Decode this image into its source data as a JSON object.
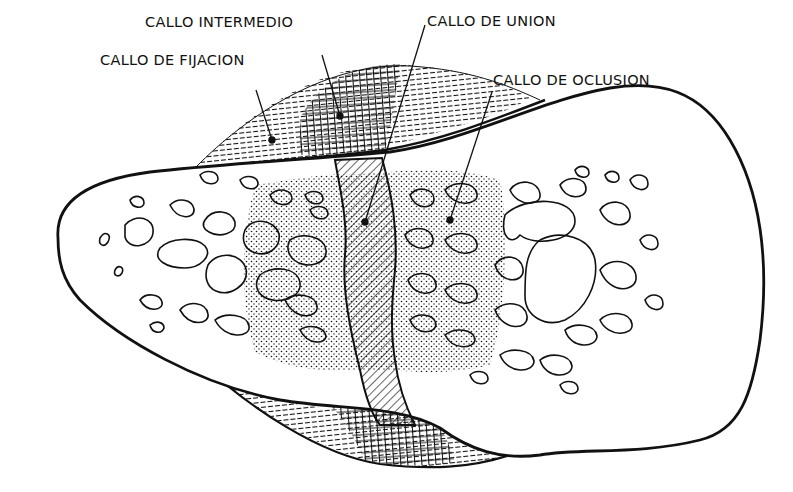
{
  "labels": {
    "intermedio": "CALLO INTERMEDIO",
    "union": "CALLO DE UNION",
    "fijacion": "CALLO DE FIJACION",
    "oclusion": "CALLO DE OCLUSION"
  },
  "colors": {
    "ink": "#111111",
    "background": "#ffffff"
  }
}
